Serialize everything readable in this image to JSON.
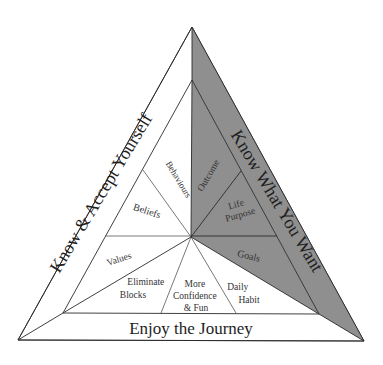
{
  "diagram": {
    "colors": {
      "background": "#ffffff",
      "shaded": "#8f8f8f",
      "line": "#2a2a2a",
      "text": "#333333"
    },
    "sides": {
      "left": "Know & Accept Yourself",
      "right": "Know What You Want",
      "bottom": "Enjoy the Journey"
    },
    "segments": {
      "behaviours": "Behaviours",
      "beliefs": "Beliefs",
      "values": "Values",
      "eliminate_blocks": [
        "Eliminate",
        "Blocks"
      ],
      "more_confidence": [
        "More",
        "Confidence",
        "& Fun"
      ],
      "daily_habit": [
        "Daily",
        "Habit"
      ],
      "goals": "Goals",
      "life_purpose": [
        "Life",
        "Purpose"
      ],
      "outcome": "Outcome"
    }
  }
}
